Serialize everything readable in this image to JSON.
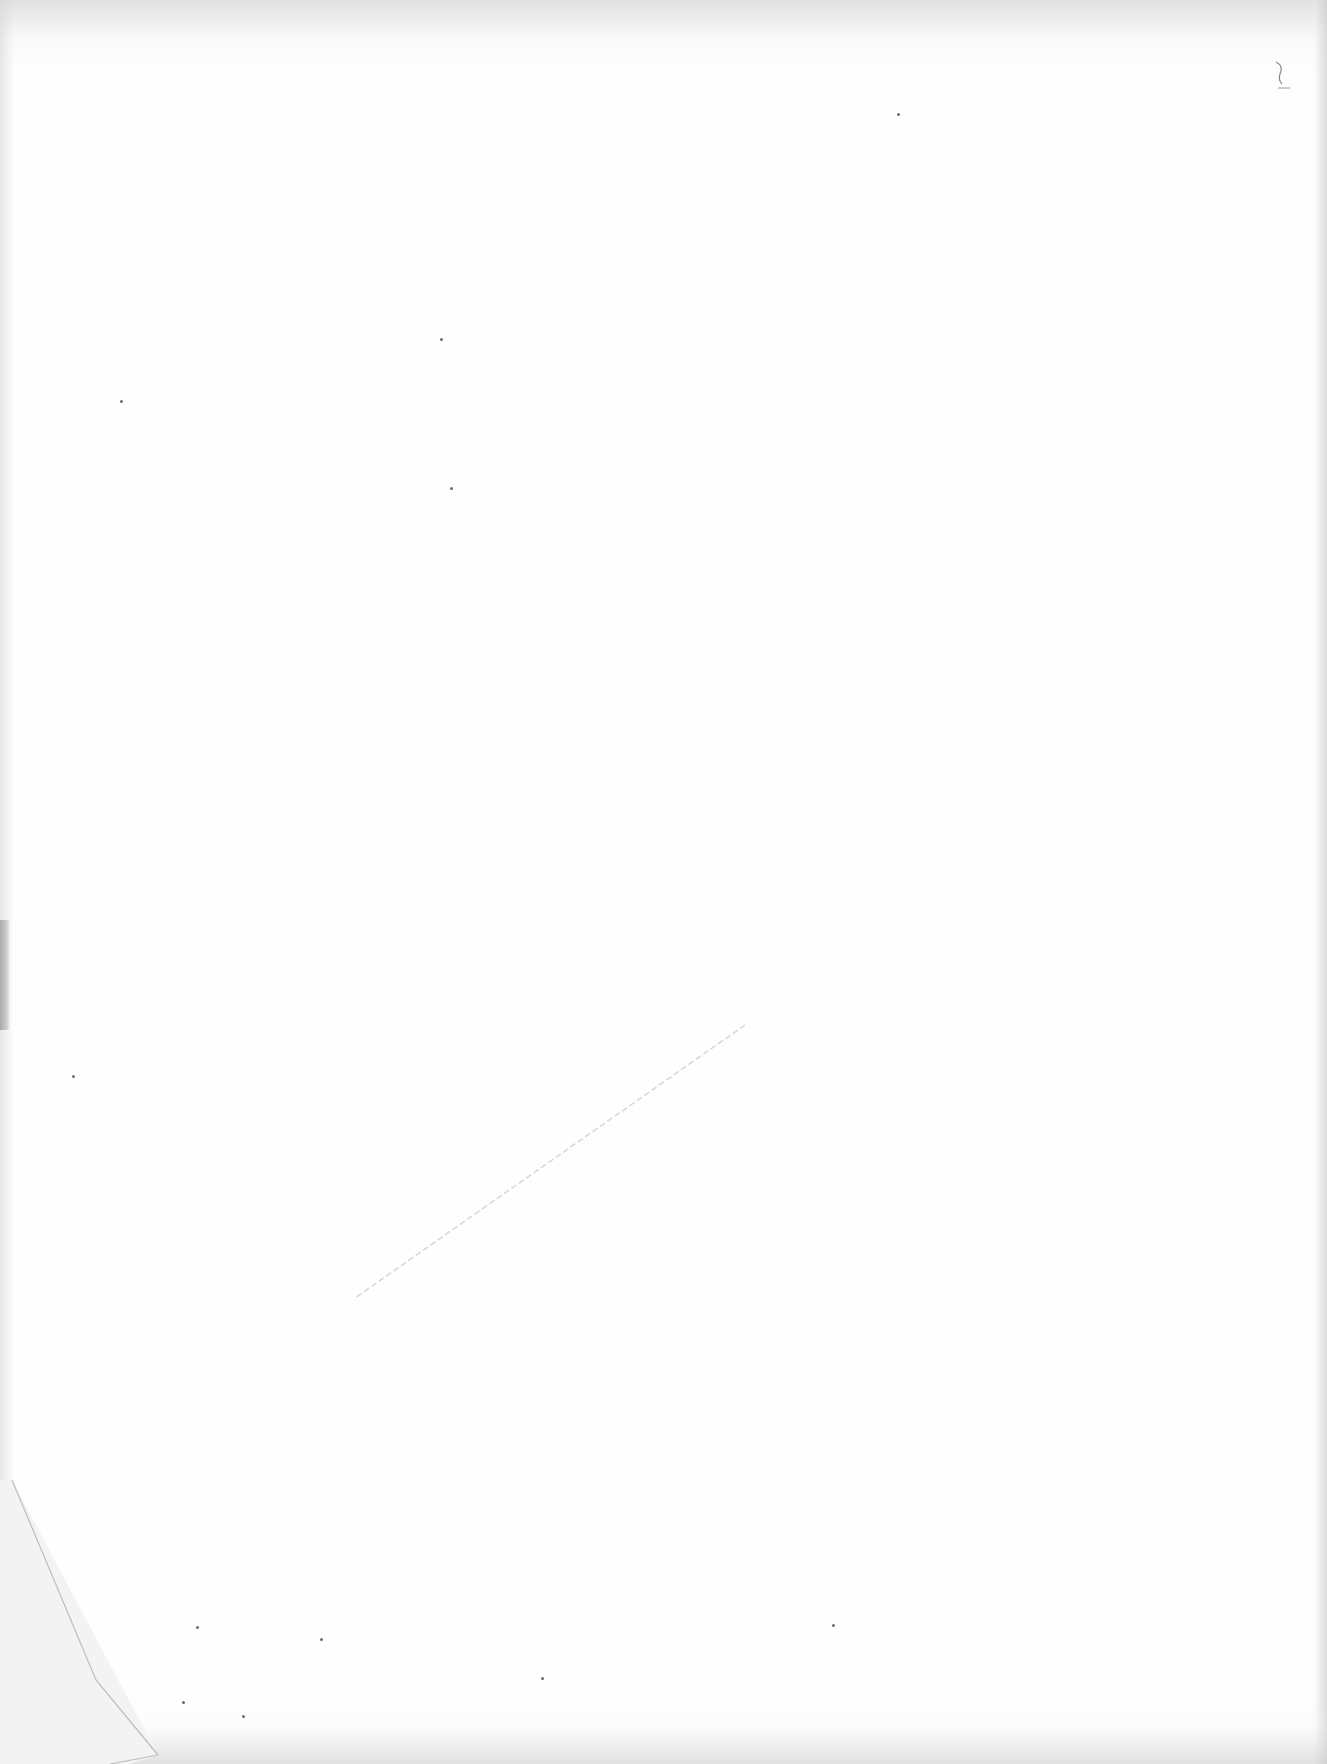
{
  "document": {
    "type": "scanned-page",
    "content": "",
    "colors": {
      "paper": "#fefefe",
      "edge_shadow": "#c8c8c8",
      "fold_shadow": "#a9a9a9"
    }
  }
}
